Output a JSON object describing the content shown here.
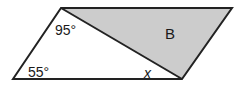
{
  "diagram": {
    "shape": "parallelogram",
    "shaded_region_label": "B",
    "angle_labels": {
      "top_left_interior": "95°",
      "bottom_left": "55°",
      "unknown": "x"
    },
    "colors": {
      "outline": "#222222",
      "shade": "#cccccc",
      "background": "#ffffff"
    }
  }
}
